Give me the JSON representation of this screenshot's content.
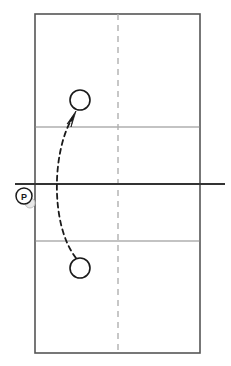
{
  "diagram": {
    "type": "court-diagram",
    "colors": {
      "court_outline": "#555555",
      "inner_line": "#888888",
      "net_line": "#333333",
      "center_dashed_line": "#b0b0b0",
      "marker_stroke": "#1a1a1a",
      "ball_fill": "#e8e8e8",
      "ball_stroke": "#c0c0c0",
      "path_stroke": "#1a1a1a",
      "background": "#ffffff"
    },
    "court": {
      "name": "court-boundary",
      "left": 35,
      "top": 14,
      "right": 200,
      "bottom": 353,
      "width": 165,
      "height": 339
    },
    "lines": [
      {
        "name": "attack-line-top",
        "label": "Attack line (far court)",
        "orientation": "horizontal",
        "y": 127,
        "x1": 35,
        "x2": 200,
        "style": "solid"
      },
      {
        "name": "attack-line-bottom",
        "label": "Attack line (near court)",
        "orientation": "horizontal",
        "y": 241,
        "x1": 35,
        "x2": 200,
        "style": "solid"
      },
      {
        "name": "net-line",
        "label": "Net",
        "orientation": "horizontal",
        "y": 184,
        "x1": 15,
        "x2": 225,
        "style": "solid-heavy"
      },
      {
        "name": "center-dashed-line",
        "label": "Center reference line",
        "orientation": "vertical",
        "x": 118,
        "y1": 14,
        "y2": 353,
        "style": "dashed"
      }
    ],
    "markers": [
      {
        "name": "player-marker-target",
        "label": "",
        "shape": "circle",
        "cx": 80,
        "cy": 100,
        "r": 10,
        "filled": false
      },
      {
        "name": "player-marker-origin",
        "label": "",
        "shape": "circle",
        "cx": 80,
        "cy": 268,
        "r": 10,
        "filled": false
      },
      {
        "name": "player-marker-passer",
        "label": "P",
        "shape": "circle-labeled",
        "cx": 24,
        "cy": 196,
        "r": 8,
        "filled": false
      },
      {
        "name": "ball-marker",
        "label": "",
        "shape": "circle-shaded",
        "cx": 30,
        "cy": 203,
        "r": 5,
        "filled": true
      }
    ],
    "paths": [
      {
        "name": "movement-path-arrow",
        "label": "Curved movement path",
        "style": "dashed-with-arrowhead",
        "from_marker": "player-marker-origin",
        "to_marker": "player-marker-target",
        "start": {
          "x": 76,
          "y": 258
        },
        "control1": {
          "x": 50,
          "y": 225
        },
        "control2": {
          "x": 52,
          "y": 150
        },
        "end": {
          "x": 73,
          "y": 117
        },
        "arrow_tip": {
          "x": 75,
          "y": 114
        },
        "arrow_direction": "up-right"
      }
    ]
  }
}
